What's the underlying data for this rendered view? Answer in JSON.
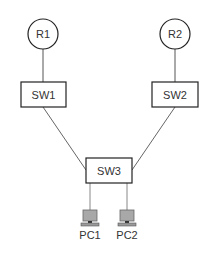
{
  "diagram": {
    "type": "network-topology",
    "nodes": {
      "r1": {
        "label": "R1",
        "kind": "router"
      },
      "r2": {
        "label": "R2",
        "kind": "router"
      },
      "sw1": {
        "label": "SW1",
        "kind": "switch"
      },
      "sw2": {
        "label": "SW2",
        "kind": "switch"
      },
      "sw3": {
        "label": "SW3",
        "kind": "switch"
      },
      "pc1": {
        "label": "PC1",
        "kind": "pc"
      },
      "pc2": {
        "label": "PC2",
        "kind": "pc"
      }
    },
    "links": [
      {
        "from": "R1",
        "to": "SW1"
      },
      {
        "from": "R2",
        "to": "SW2"
      },
      {
        "from": "SW1",
        "to": "SW3"
      },
      {
        "from": "SW2",
        "to": "SW3"
      },
      {
        "from": "SW3",
        "to": "PC1"
      },
      {
        "from": "SW3",
        "to": "PC2"
      }
    ],
    "colors": {
      "line": "#555555",
      "border": "#222222",
      "pc_screen": "#a8a8a8",
      "pc_frame": "#666666"
    }
  }
}
